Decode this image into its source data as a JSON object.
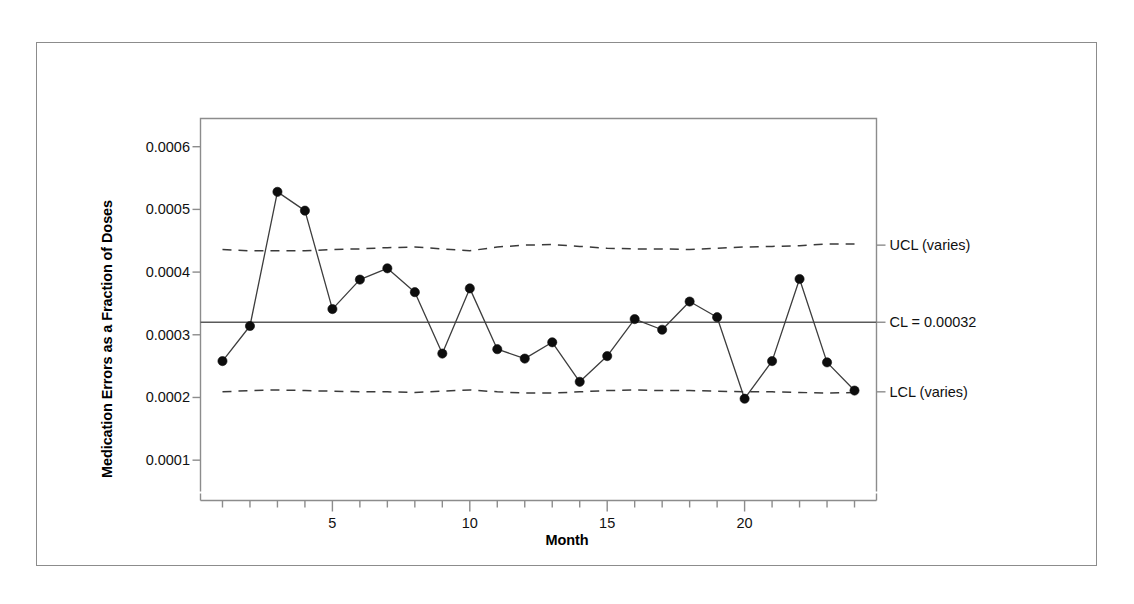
{
  "chart_data": {
    "type": "line",
    "title": "",
    "xlabel": "Month",
    "ylabel": "Medication Errors as a Fraction of Doses",
    "xlim": [
      0.2,
      24.8
    ],
    "ylim": [
      5e-05,
      0.000645
    ],
    "grid": false,
    "legend_position": "right-annotations",
    "x": [
      1,
      2,
      3,
      4,
      5,
      6,
      7,
      8,
      9,
      10,
      11,
      12,
      13,
      14,
      15,
      16,
      17,
      18,
      19,
      20,
      21,
      22,
      23,
      24
    ],
    "series": [
      {
        "name": "Medication errors as a fraction of doses",
        "values": [
          0.000258,
          0.000314,
          0.000528,
          0.000498,
          0.000341,
          0.000388,
          0.000406,
          0.000368,
          0.00027,
          0.000374,
          0.000277,
          0.000262,
          0.000288,
          0.000225,
          0.000266,
          0.000325,
          0.000308,
          0.000353,
          0.000328,
          0.000198,
          0.000258,
          0.000389,
          0.000256,
          0.000211
        ],
        "marker": "filled-circle",
        "color": "#000000"
      },
      {
        "name": "UCL (varies)",
        "style": "dashed",
        "color": "#3a3a3a",
        "values": [
          0.000436,
          0.000434,
          0.000434,
          0.000434,
          0.000436,
          0.000437,
          0.000439,
          0.00044,
          0.000437,
          0.000434,
          0.00044,
          0.000443,
          0.000444,
          0.000441,
          0.000438,
          0.000437,
          0.000437,
          0.000436,
          0.000438,
          0.00044,
          0.000441,
          0.000442,
          0.000445,
          0.000445
        ]
      },
      {
        "name": "CL = 0.00032",
        "style": "solid",
        "color": "#5a5a5a",
        "constant": 0.00032
      },
      {
        "name": "LCL (varies)",
        "style": "dashed",
        "color": "#3a3a3a",
        "values": [
          0.000209,
          0.000211,
          0.000212,
          0.000211,
          0.00021,
          0.000209,
          0.000209,
          0.000208,
          0.00021,
          0.000212,
          0.000209,
          0.000207,
          0.000207,
          0.000209,
          0.000211,
          0.000212,
          0.000211,
          0.000211,
          0.00021,
          0.000209,
          0.000209,
          0.000208,
          0.000207,
          0.000208
        ]
      }
    ],
    "yticks": [
      0.0001,
      0.0002,
      0.0003,
      0.0004,
      0.0005,
      0.0006
    ],
    "ytick_labels": [
      "0.0001",
      "0.0002",
      "0.0003",
      "0.0004",
      "0.0005",
      "0.0006"
    ],
    "xticks": [
      5,
      10,
      15,
      20
    ],
    "xtick_labels": [
      "5",
      "10",
      "15",
      "20"
    ],
    "xminor_ticks": [
      1,
      2,
      3,
      4,
      5,
      6,
      7,
      8,
      9,
      10,
      11,
      12,
      13,
      14,
      15,
      16,
      17,
      18,
      19,
      20,
      21,
      22,
      23,
      24
    ],
    "annotations": [
      {
        "id": "ucl",
        "text": "UCL (varies)",
        "value": 0.000443
      },
      {
        "id": "cl",
        "text": "CL = 0.00032",
        "value": 0.00032
      },
      {
        "id": "lcl",
        "text": "LCL (varies)",
        "value": 0.000209
      }
    ]
  },
  "labels": {
    "y_axis_title": "Medication Errors as a Fraction of Doses",
    "x_axis_title": "Month",
    "ucl": "UCL (varies)",
    "cl": "CL = 0.00032",
    "lcl": "LCL (varies)",
    "ytick_0": "0.0001",
    "ytick_1": "0.0002",
    "ytick_2": "0.0003",
    "ytick_3": "0.0004",
    "ytick_4": "0.0005",
    "ytick_5": "0.0006",
    "xtick_0": "5",
    "xtick_1": "10",
    "xtick_2": "15",
    "xtick_3": "20"
  },
  "colors": {
    "frame": "#8c8c8c",
    "data_line": "#3d3d3d",
    "marker": "#0d0d0d",
    "center_line": "#5a5a5a",
    "limit_line": "#3a3a3a",
    "text": "#111111"
  }
}
